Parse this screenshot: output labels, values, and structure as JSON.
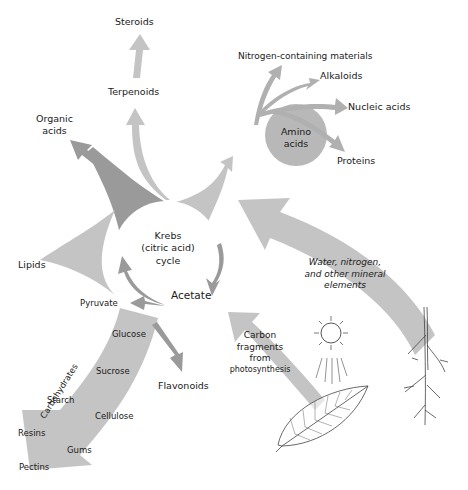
{
  "diagram": {
    "center": {
      "krebs_line1": "Krebs",
      "krebs_line2": "(citric acid)",
      "krebs_line3": "cycle",
      "acetate": "Acetate",
      "pyruvate": "Pyruvate"
    },
    "top_products": {
      "steroids": "Steroids",
      "terpenoids": "Terpenoids",
      "organic_acids_line1": "Organic",
      "organic_acids_line2": "acids",
      "lipids": "Lipids"
    },
    "amino_acids": {
      "label_line1": "Amino",
      "label_line2": "acids",
      "products": {
        "nitrogen_materials": "Nitrogen-containing materials",
        "alkaloids": "Alkaloids",
        "nucleic_acids": "Nucleic acids",
        "proteins": "Proteins"
      }
    },
    "carbohydrates": {
      "band_label": "Carbohydrates",
      "glucose": "Glucose",
      "sucrose": "Sucrose",
      "starch": "Starch",
      "cellulose": "Cellulose",
      "resins": "Resins",
      "gums": "Gums",
      "pectins": "Pectins",
      "flavonoids": "Flavonoids"
    },
    "inputs": {
      "minerals_line1": "Water, nitrogen,",
      "minerals_line2": "and other mineral",
      "minerals_line3": "elements",
      "carbon_line1": "Carbon",
      "carbon_line2": "fragments",
      "carbon_line3": "from",
      "carbon_line4": "photosynthesis"
    },
    "colors": {
      "arrow_light": "#c4c4c4",
      "arrow_mid": "#b5b5b5",
      "arrow_dark": "#9a9a9a",
      "circle_amino": "#b8b8b8",
      "text": "#1a1a1a",
      "background": "#ffffff"
    }
  }
}
